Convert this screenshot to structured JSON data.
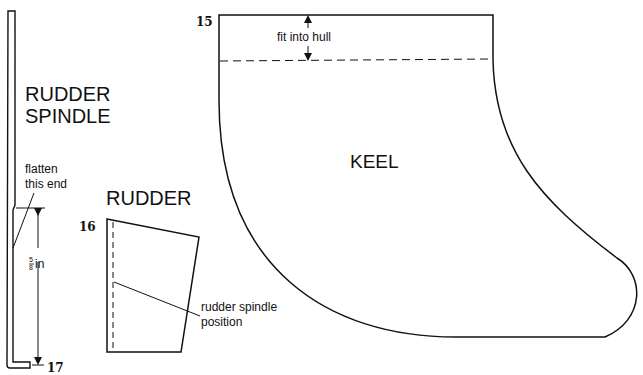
{
  "diagram": {
    "parts": {
      "spindle": {
        "title_line1": "RUDDER",
        "title_line2": "SPINDLE",
        "note_line1": "flatten",
        "note_line2": "this end",
        "dimension_num": "5",
        "dimension_den": "8",
        "dimension_unit": "in",
        "number": "17"
      },
      "rudder": {
        "title": "RUDDER",
        "number": "16",
        "note_line1": "rudder spindle",
        "note_line2": "position"
      },
      "keel": {
        "title": "KEEL",
        "number": "15",
        "note": "fit into hull"
      }
    },
    "colors": {
      "line": "#111111",
      "background": "#ffffff"
    }
  }
}
